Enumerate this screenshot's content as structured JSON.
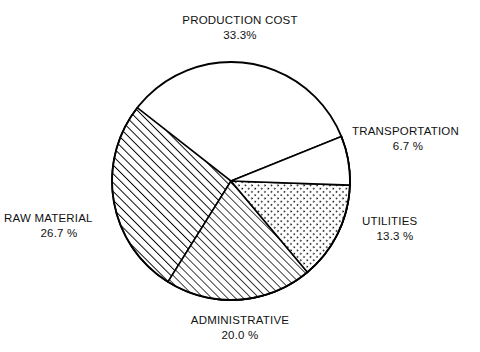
{
  "chart_data": {
    "type": "pie",
    "title": "",
    "subtitle": "",
    "xlabel": "",
    "ylabel": "",
    "legend_position": "around-slices",
    "grid": false,
    "units": "%",
    "total": 100.0,
    "categories": [
      "PRODUCTION COST",
      "TRANSPORTATION",
      "UTILITIES",
      "ADMINISTRATIVE",
      "RAW MATERIAL"
    ],
    "values": [
      33.3,
      6.7,
      13.3,
      20.0,
      26.7
    ],
    "slices": [
      {
        "label": "PRODUCTION COST",
        "value": 33.3,
        "value_text": "33.3%",
        "pattern": "cross-hatch",
        "fill_color": "#ffffff",
        "stroke_color": "#000000",
        "start_angle_deg": -22,
        "sweep_deg": 120,
        "label_position": "top"
      },
      {
        "label": "TRANSPORTATION",
        "value": 6.7,
        "value_text": "6.7 %",
        "pattern": "blank",
        "fill_color": "#ffffff",
        "stroke_color": "#000000",
        "start_angle_deg": -22,
        "sweep_deg": 24,
        "label_position": "right-upper"
      },
      {
        "label": "UTILITIES",
        "value": 13.3,
        "value_text": "13.3 %",
        "pattern": "dotted",
        "fill_color": "#ffffff",
        "stroke_color": "#000000",
        "start_angle_deg": 2,
        "sweep_deg": 48,
        "label_position": "right-lower"
      },
      {
        "label": "ADMINISTRATIVE",
        "value": 20.0,
        "value_text": "20.0 %",
        "pattern": "diagonal-hatch-fine",
        "fill_color": "#ffffff",
        "stroke_color": "#000000",
        "start_angle_deg": 50,
        "sweep_deg": 72,
        "label_position": "bottom"
      },
      {
        "label": "RAW MATERIAL",
        "value": 26.7,
        "value_text": "26.7 %",
        "pattern": "diagonal-hatch",
        "fill_color": "#ffffff",
        "stroke_color": "#000000",
        "start_angle_deg": 122,
        "sweep_deg": 96,
        "label_position": "left"
      }
    ],
    "geometry": {
      "center_x": 231,
      "center_y": 181,
      "radius": 119
    },
    "colors": {
      "background": "#ffffff",
      "outline": "#000000",
      "text": "#111111"
    }
  },
  "labels": {
    "production_cost": {
      "name": "PRODUCTION COST",
      "value": "33.3%"
    },
    "transportation": {
      "name": "TRANSPORTATION",
      "value": "6.7 %"
    },
    "utilities": {
      "name": "UTILITIES",
      "value": "13.3 %"
    },
    "administrative": {
      "name": "ADMINISTRATIVE",
      "value": "20.0 %"
    },
    "raw_material": {
      "name": "RAW MATERIAL",
      "value": "26.7 %"
    }
  }
}
